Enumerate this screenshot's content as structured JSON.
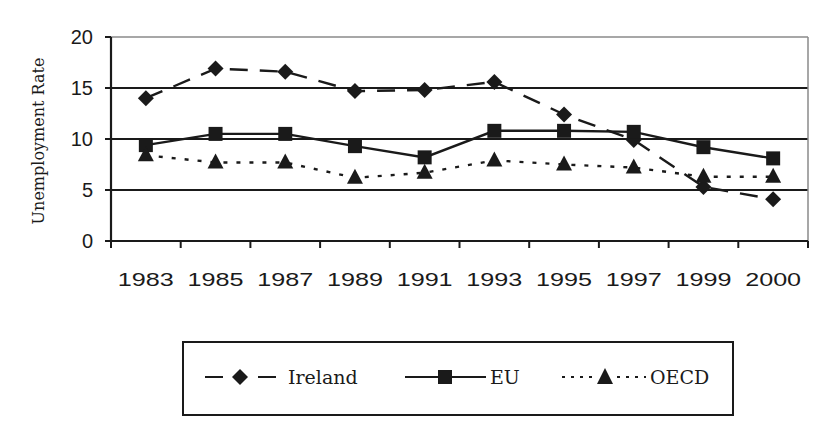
{
  "chart_data": {
    "type": "line",
    "title": "",
    "xlabel": "",
    "ylabel": "Unemployment Rate",
    "ylim": [
      0,
      20
    ],
    "yticks": [
      0,
      5,
      10,
      15,
      20
    ],
    "grid": true,
    "legend_position": "bottom",
    "categories": [
      "1983",
      "1985",
      "1987",
      "1989",
      "1991",
      "1993",
      "1995",
      "1997",
      "1999",
      "2000"
    ],
    "series": [
      {
        "name": "Ireland",
        "style": "dashed",
        "marker": "diamond",
        "values": [
          14.0,
          16.9,
          16.6,
          14.7,
          14.8,
          15.6,
          12.4,
          9.9,
          5.3,
          4.1
        ]
      },
      {
        "name": "EU",
        "style": "solid",
        "marker": "square",
        "values": [
          9.4,
          10.5,
          10.5,
          9.3,
          8.2,
          10.8,
          10.8,
          10.7,
          9.2,
          8.1
        ]
      },
      {
        "name": "OECD",
        "style": "dotted",
        "marker": "triangle",
        "values": [
          8.4,
          7.7,
          7.7,
          6.2,
          6.7,
          7.9,
          7.5,
          7.2,
          6.3,
          6.3
        ]
      }
    ]
  },
  "colors": {
    "series": "#1a1a1a",
    "grid": "#1a1a1a",
    "frame": "#8a8a8a"
  }
}
